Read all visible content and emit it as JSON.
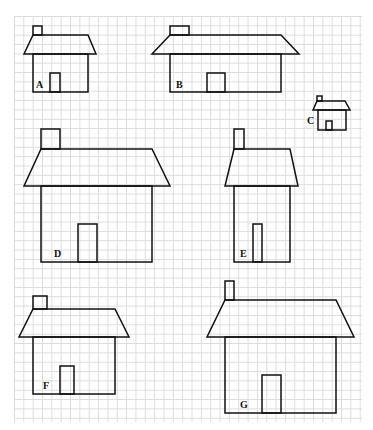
{
  "figure": {
    "houses": [
      {
        "label": "A",
        "chimney": [
          33,
          26,
          9,
          9
        ],
        "roof": [
          33,
          35,
          88,
          35,
          96,
          54,
          24,
          54
        ],
        "body": [
          33,
          54,
          55,
          38
        ],
        "door": [
          50,
          73,
          10,
          19
        ],
        "label_pos": [
          36,
          88
        ]
      },
      {
        "label": "B",
        "chimney": [
          170,
          26,
          19,
          9
        ],
        "roof": [
          170,
          35,
          281,
          35,
          299,
          54,
          152,
          54
        ],
        "body": [
          170,
          54,
          111,
          38
        ],
        "door": [
          207,
          73,
          18,
          19
        ],
        "label_pos": [
          176,
          88
        ]
      },
      {
        "label": "C",
        "chimney": [
          317,
          96,
          5,
          5
        ],
        "roof": [
          317,
          101,
          345,
          101,
          350,
          110,
          313,
          110
        ],
        "body": [
          318,
          110,
          28,
          20
        ],
        "door": [
          326,
          121,
          6,
          9
        ],
        "label_pos": [
          307,
          124
        ]
      },
      {
        "label": "D",
        "chimney": [
          41,
          129,
          19,
          20
        ],
        "roof": [
          41,
          149,
          152,
          149,
          170,
          186,
          24,
          186
        ],
        "body": [
          41,
          186,
          111,
          76
        ],
        "door": [
          78,
          224,
          19,
          38
        ],
        "label_pos": [
          54,
          257
        ]
      },
      {
        "label": "E",
        "chimney": [
          234,
          129,
          10,
          20
        ],
        "roof": [
          234,
          149,
          290,
          149,
          298,
          186,
          225,
          186
        ],
        "body": [
          234,
          186,
          56,
          76
        ],
        "door": [
          253,
          224,
          9,
          38
        ],
        "label_pos": [
          240,
          257
        ]
      },
      {
        "label": "F",
        "chimney": [
          33,
          296,
          14,
          13
        ],
        "roof": [
          33,
          309,
          115,
          309,
          129,
          337,
          19,
          337
        ],
        "body": [
          33,
          337,
          82,
          57
        ],
        "door": [
          60,
          366,
          14,
          28
        ],
        "label_pos": [
          43,
          389
        ]
      },
      {
        "label": "G",
        "chimney": [
          225,
          281,
          9,
          19
        ],
        "roof": [
          225,
          300,
          336,
          300,
          354,
          337,
          207,
          337
        ],
        "body": [
          225,
          337,
          111,
          76
        ],
        "door": [
          262,
          375,
          19,
          38
        ],
        "label_pos": [
          240,
          408
        ]
      }
    ]
  },
  "colors": {
    "stroke": "#111111",
    "grid": "#dcdcdc",
    "background": "#ffffff"
  }
}
